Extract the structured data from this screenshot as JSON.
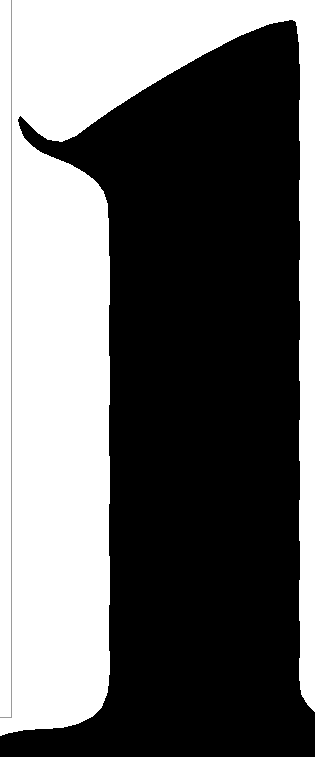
{
  "viewer": {
    "width": 315,
    "height": 757,
    "background_color": "#ffffff",
    "content_description": "extreme close-up crop of a scanned serif numeral one"
  },
  "page_rule": {
    "color": "#9a9a9a",
    "thickness_px": 1,
    "vertical_x": 11,
    "vertical_top": 0,
    "vertical_bottom": 718,
    "horizontal_y": 717,
    "horizontal_left": 0,
    "horizontal_right": 12
  },
  "glyph": {
    "character": "1",
    "style": "serif",
    "ink_color": "#000000",
    "anti_aliased": false,
    "edges": "ragged scan artifact edges",
    "bounds": {
      "left": 18,
      "top": 20,
      "right": 315,
      "bottom": 757
    },
    "features": {
      "flag_tip_x": 20,
      "flag_tip_y": 120,
      "apex_x": 296,
      "apex_y": 22,
      "stem_left_x": 109,
      "stem_right_x": 298,
      "foot_serif_top_y": 706
    },
    "outline_path": "M 296,22 L 292,20 L 270,24 L 240,36 L 205,54 L 170,74 L 140,92 L 112,110 L 92,124 L 76,136 L 62,142 L 48,140 L 36,132 L 26,122 L 20,116 L 18,120 L 20,128 L 24,137 L 31,145 L 41,152 L 55,158 L 70,164 L 84,172 L 96,181 L 104,192 L 108,205 L 109,230 L 110,280 L 109,330 L 110,380 L 109,430 L 110,480 L 109,530 L 110,580 L 109,630 L 110,670 L 108,692 L 102,707 L 92,717 L 78,724 L 62,728 L 44,729 L 26,730 L 10,733 L 0,736 L 0,757 L 315,757 L 315,712 L 308,706 L 301,694 L 299,676 L 300,640 L 299,600 L 300,560 L 299,520 L 300,480 L 299,440 L 300,400 L 299,360 L 300,320 L 299,280 L 300,240 L 299,200 L 300,160 L 299,120 L 300,80 L 299,46 Z"
  }
}
